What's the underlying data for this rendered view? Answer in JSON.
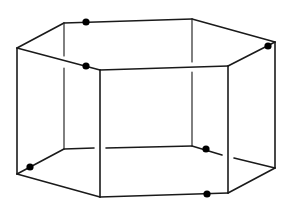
{
  "diagram": {
    "type": "hexagonal-prism-wireframe",
    "colors": {
      "line": "#1a1a1a",
      "point": "#000000",
      "background": "#ffffff"
    },
    "top_face": {
      "vertices": [
        [
          17,
          48
        ],
        [
          64,
          23
        ],
        [
          192,
          19
        ],
        [
          275,
          42
        ],
        [
          228,
          66
        ],
        [
          100,
          70
        ]
      ]
    },
    "bottom_face": {
      "vertices": [
        [
          17,
          174
        ],
        [
          64,
          149
        ],
        [
          192,
          146
        ],
        [
          275,
          168
        ],
        [
          228,
          193
        ],
        [
          100,
          197
        ]
      ]
    },
    "points": [
      {
        "id": "p1",
        "x": 86,
        "y": 22,
        "location": "top back-left edge"
      },
      {
        "id": "p2",
        "x": 86,
        "y": 66,
        "location": "top front-left edge"
      },
      {
        "id": "p3",
        "x": 268,
        "y": 46,
        "location": "top right vertex"
      },
      {
        "id": "p4",
        "x": 30,
        "y": 167,
        "location": "bottom left edge"
      },
      {
        "id": "p5",
        "x": 206,
        "y": 149,
        "location": "bottom back-right edge"
      },
      {
        "id": "p6",
        "x": 207,
        "y": 194,
        "location": "bottom front edge"
      }
    ]
  }
}
